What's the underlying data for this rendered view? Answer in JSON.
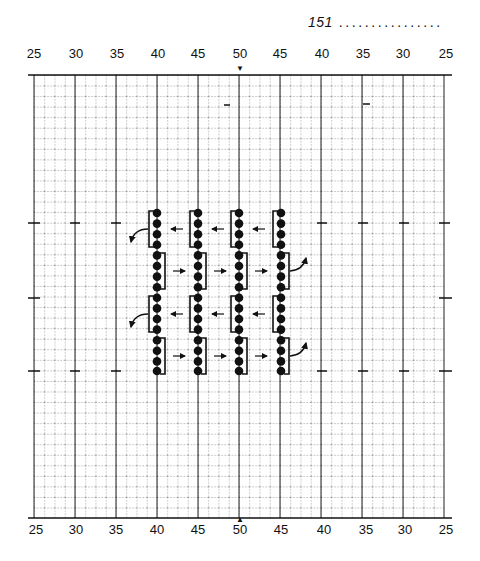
{
  "header": {
    "page_number": "151",
    "fill_dots": "................"
  },
  "scale": {
    "top_labels": [
      "25",
      "30",
      "35",
      "40",
      "45",
      "50",
      "45",
      "40",
      "35",
      "30",
      "25"
    ],
    "bottom_labels": [
      "25",
      "30",
      "35",
      "40",
      "45",
      "50",
      "45",
      "40",
      "35",
      "30",
      "25"
    ],
    "center_marker_top": "v",
    "center_marker_bottom": "^"
  },
  "diagram": {
    "type": "chart-paper threading diagram",
    "columns": 4,
    "beads_per_column": 16,
    "column_labels": [
      "40",
      "45",
      "50",
      "45"
    ],
    "upper_section_arrows": "left",
    "lower_section_arrows": "right",
    "colors": {
      "ink": "#111111",
      "grid": "#555555",
      "paper": "#ffffff"
    }
  }
}
